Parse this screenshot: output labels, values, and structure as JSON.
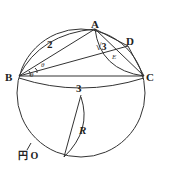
{
  "diagram": {
    "points": {
      "A": "A",
      "B": "B",
      "C": "C",
      "D": "D"
    },
    "edge_labels": {
      "AB": "2",
      "AC": "√3",
      "BC": "3",
      "radius": "R"
    },
    "angle_labels": {
      "ABD": "θ",
      "DBC": "θ",
      "intersection": "E"
    },
    "circle_label": "円 O",
    "colors": {
      "stroke": "#333333",
      "background": "#ffffff"
    }
  }
}
